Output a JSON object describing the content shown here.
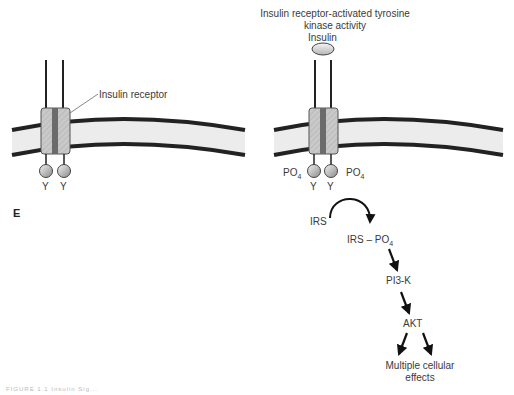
{
  "title": {
    "line1": "Insulin receptor-activated tyrosine",
    "line2": "kinase activity"
  },
  "panel_label": "E",
  "left": {
    "receptor_label": "Insulin receptor",
    "tyrosines": [
      "Y",
      "Y"
    ]
  },
  "right": {
    "ligand_label": "Insulin",
    "tyrosines": [
      "Y",
      "Y"
    ],
    "phosphate_left": "PO",
    "phosphate_right": "PO",
    "subscript": "4"
  },
  "pathway": {
    "irs": "IRS",
    "irs_po4_prefix": "IRS – PO",
    "irs_po4_sub": "4",
    "pi3k": "PI3-K",
    "akt": "AKT",
    "effects_line1": "Multiple cellular",
    "effects_line2": "effects"
  },
  "caption": "FIGURE 1.1 Insulin Sig..."
}
